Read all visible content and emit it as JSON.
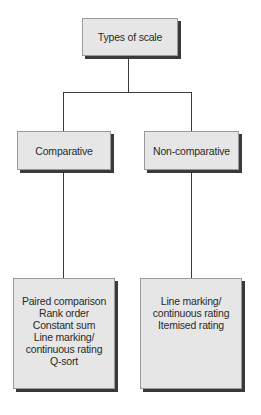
{
  "diagram": {
    "type": "tree",
    "root": {
      "label": "Types of scale"
    },
    "branches": [
      {
        "label": "Comparative",
        "items": [
          "Paired comparison",
          "Rank order",
          "Constant sum",
          "Line marking/",
          "continuous rating",
          "Q-sort"
        ]
      },
      {
        "label": "Non-comparative",
        "items": [
          "Line marking/",
          "continuous rating",
          "Itemised rating"
        ]
      }
    ]
  },
  "colors": {
    "box_fill": "#e6e6e6",
    "box_border": "#9a9a9a",
    "shadow": "#3a3a3a",
    "line": "#3a3a3a",
    "text": "#2a2a2a"
  }
}
